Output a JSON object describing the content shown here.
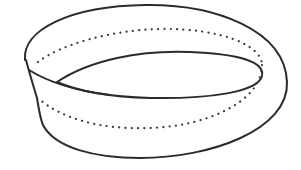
{
  "figure": {
    "width": 301,
    "height": 170,
    "background": "#ffffff",
    "stroke_color": "#2b2b2b",
    "parts": [
      {
        "name": "outer-edge",
        "style": "solid"
      },
      {
        "name": "inner-loop-edge",
        "style": "solid"
      },
      {
        "name": "twist-edge",
        "style": "solid"
      },
      {
        "name": "centerline",
        "style": "dotted"
      }
    ]
  }
}
